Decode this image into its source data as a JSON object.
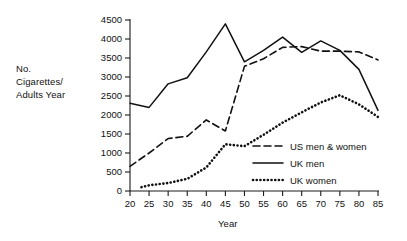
{
  "chart_data": {
    "type": "line",
    "title": "",
    "xlabel": "Year",
    "ylabel": "No. Cigarettes/ Adults Year",
    "ylabel_lines": [
      "No.",
      "Cigarettes/",
      "Adults Year"
    ],
    "xlim": [
      20,
      85
    ],
    "ylim": [
      0,
      4500
    ],
    "xticks": [
      20,
      25,
      30,
      35,
      40,
      45,
      50,
      55,
      60,
      65,
      70,
      75,
      80,
      85
    ],
    "yticks": [
      0,
      500,
      1000,
      1500,
      2000,
      2500,
      3000,
      3500,
      4000,
      4500
    ],
    "xtick_labels": [
      "20",
      "25",
      "30",
      "35",
      "40",
      "45",
      "50",
      "55",
      "60",
      "65",
      "70",
      "75",
      "80",
      "85"
    ],
    "ytick_labels": [
      "0",
      "500",
      "1000",
      "1500",
      "2000",
      "2500",
      "3000",
      "3500",
      "4000",
      "4500"
    ],
    "grid": false,
    "legend_position": "center-right",
    "line_color": "#111111",
    "series": [
      {
        "name": "US men & women",
        "style": "dashed",
        "x": [
          20,
          25,
          30,
          35,
          40,
          45,
          50,
          55,
          60,
          65,
          70,
          75,
          80,
          85
        ],
        "values": [
          650,
          1000,
          1380,
          1440,
          1870,
          1580,
          3280,
          3480,
          3780,
          3800,
          3680,
          3680,
          3660,
          3450
        ]
      },
      {
        "name": "UK men",
        "style": "solid",
        "x": [
          20,
          25,
          30,
          35,
          40,
          45,
          50,
          55,
          60,
          65,
          70,
          75,
          80,
          85
        ],
        "values": [
          2310,
          2200,
          2820,
          2980,
          3660,
          4400,
          3400,
          3700,
          4050,
          3650,
          3950,
          3700,
          3200,
          2120
        ]
      },
      {
        "name": "UK women",
        "style": "dotted",
        "x": [
          23,
          25,
          30,
          35,
          40,
          45,
          50,
          55,
          60,
          65,
          70,
          75,
          80,
          85
        ],
        "values": [
          100,
          150,
          210,
          320,
          620,
          1230,
          1180,
          1480,
          1800,
          2070,
          2330,
          2520,
          2280,
          1950
        ]
      }
    ]
  },
  "legend": {
    "items": [
      {
        "label": "US men & women",
        "style": "dashed"
      },
      {
        "label": "UK men",
        "style": "solid"
      },
      {
        "label": "UK women",
        "style": "dotted"
      }
    ]
  }
}
